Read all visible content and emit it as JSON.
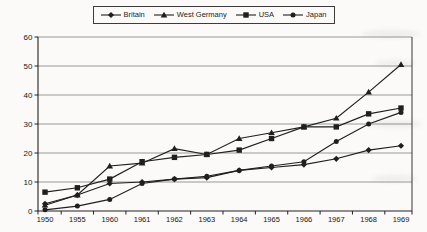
{
  "chart_data": {
    "type": "line",
    "title": "",
    "xlabel": "",
    "ylabel": "",
    "categories": [
      "1950",
      "1955",
      "1960",
      "1961",
      "1962",
      "1963",
      "1964",
      "1965",
      "1966",
      "1967",
      "1968",
      "1969"
    ],
    "series": [
      {
        "name": "Britain",
        "marker": "diamond",
        "color": "#1f1f1f",
        "values": [
          2.5,
          5.5,
          9.5,
          10,
          11,
          11.5,
          14,
          15,
          16,
          18,
          21,
          22.5
        ]
      },
      {
        "name": "West Germany",
        "marker": "triangle",
        "color": "#1f1f1f",
        "values": [
          2,
          5.5,
          15.5,
          16.5,
          21.5,
          19.5,
          25,
          27,
          29,
          32,
          41,
          50.5
        ]
      },
      {
        "name": "USA",
        "marker": "square",
        "color": "#1f1f1f",
        "values": [
          6.5,
          8,
          11,
          17,
          18.5,
          19.5,
          21,
          25,
          29,
          29,
          33.5,
          35.5
        ]
      },
      {
        "name": "Japan",
        "marker": "circle",
        "color": "#1f1f1f",
        "values": [
          0.4,
          1.7,
          4,
          9.5,
          11,
          12,
          14,
          15.5,
          17,
          24,
          30,
          34
        ]
      }
    ],
    "ylim": [
      0,
      60
    ],
    "y_ticks": [
      0,
      10,
      20,
      30,
      40,
      50,
      60
    ],
    "grid": true,
    "gridline_color": "#6e6e6e",
    "axis_color": "#222222",
    "line_color": "#1f1f1f",
    "legend_position": "top-center",
    "legend_border": true
  }
}
